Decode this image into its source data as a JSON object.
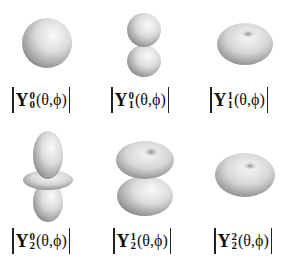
{
  "figure": {
    "title": "",
    "panels": [
      {
        "name": "Y00",
        "l": "0",
        "m": "0",
        "symbol": "Y",
        "args": "(θ,ϕ)",
        "shape": "sphere"
      },
      {
        "name": "Y10",
        "l": "1",
        "m": "0",
        "symbol": "Y",
        "args": "(θ,ϕ)",
        "shape": "two-lobes-vertical"
      },
      {
        "name": "Y11",
        "l": "1",
        "m": "1",
        "symbol": "Y",
        "args": "(θ,ϕ)",
        "shape": "torus"
      },
      {
        "name": "Y20",
        "l": "2",
        "m": "0",
        "symbol": "Y",
        "args": "(θ,ϕ)",
        "shape": "two-lobes-with-ring"
      },
      {
        "name": "Y21",
        "l": "2",
        "m": "1",
        "symbol": "Y",
        "args": "(θ,ϕ)",
        "shape": "double-torus"
      },
      {
        "name": "Y22",
        "l": "2",
        "m": "2",
        "symbol": "Y",
        "args": "(θ,ϕ)",
        "shape": "flat-torus"
      }
    ]
  }
}
